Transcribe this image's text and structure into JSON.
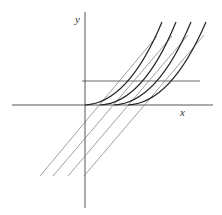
{
  "diagram": {
    "type": "family of parabolas with parallel tangent lines",
    "axes": {
      "x_label": "x",
      "y_label": "y"
    },
    "colors": {
      "curve": "#222222",
      "tangent": "#666666",
      "axis": "#444444"
    },
    "parabola_vertices_px": [
      85,
      100,
      114,
      128
    ],
    "tangent_line_count": 4,
    "horizontal_line": true
  }
}
